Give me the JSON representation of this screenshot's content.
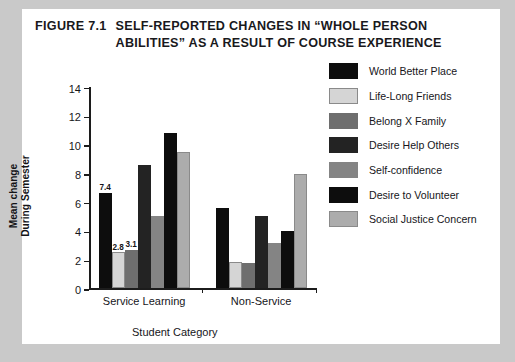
{
  "figure": {
    "label": "FIGURE 7.1",
    "title": "SELF-REPORTED CHANGES IN “WHOLE PERSON ABILITIES” AS A RESULT OF COURSE EXPERIENCE"
  },
  "chart_data": {
    "type": "bar",
    "title": "SELF-REPORTED CHANGES IN “WHOLE PERSON ABILITIES” AS A RESULT OF COURSE EXPERIENCE",
    "xlabel": "Student Category",
    "ylabel": "Mean change During Semester",
    "ylabel_lines": [
      "Mean change",
      "During Semester"
    ],
    "categories": [
      "Service Learning",
      "Non-Service"
    ],
    "ylim": [
      0,
      14
    ],
    "yticks": [
      0,
      2,
      4,
      6,
      8,
      10,
      12,
      14
    ],
    "ytick_labels": [
      "0",
      "2",
      "4",
      "6",
      "8",
      "10",
      "12",
      "14"
    ],
    "grid": false,
    "legend_position": "right",
    "series": [
      {
        "name": "World Better Place",
        "color": "#0d0d0d",
        "values": [
          6.6,
          5.6
        ]
      },
      {
        "name": "Life-Long Friends",
        "color": "#d5d5d5",
        "values": [
          2.5,
          1.85
        ]
      },
      {
        "name": "Belong X Family",
        "color": "#6e6e6e",
        "values": [
          2.7,
          1.75
        ]
      },
      {
        "name": "Desire Help Others",
        "color": "#232323",
        "values": [
          8.6,
          5.0
        ]
      },
      {
        "name": "Self-confidence",
        "color": "#848484",
        "values": [
          5.0,
          3.15
        ]
      },
      {
        "name": "Desire to Volunteer",
        "color": "#0d0d0d",
        "values": [
          10.8,
          4.0
        ]
      },
      {
        "name": "Social Justice Concern",
        "color": "#acacac",
        "values": [
          9.5,
          7.95
        ]
      }
    ],
    "data_labels": [
      {
        "group": 0,
        "series": 0,
        "text": "7.4"
      },
      {
        "group": 0,
        "series": 1,
        "text": "2.8"
      },
      {
        "group": 0,
        "series": 2,
        "text": "3.1"
      }
    ]
  },
  "colors": {
    "page_background": "#c9c9c9",
    "panel_background": "#ffffff",
    "ink": "#16161a"
  }
}
